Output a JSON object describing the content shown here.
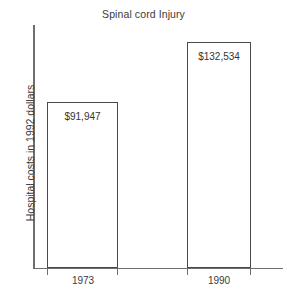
{
  "chart_data": {
    "type": "bar",
    "title": "Spinal cord Injury",
    "xlabel": "",
    "ylabel": "Hospital costs in 1992 dollars",
    "categories": [
      "1973",
      "1990"
    ],
    "values": [
      91947,
      132534
    ],
    "value_labels": [
      "$91,947",
      "$132,534"
    ],
    "ylim": [
      0,
      152000
    ],
    "grid": false,
    "legend": null,
    "axis_tick_labels_y": []
  },
  "figure": {
    "title": "Spinal cord Injury",
    "y_axis_title": "Hospital costs in 1992 dollars",
    "bars": [
      {
        "category": "1973",
        "value_label": "$91,947"
      },
      {
        "category": "1990",
        "value_label": "$132,534"
      }
    ]
  },
  "colors": {
    "background": "#ffffff",
    "bar_outline": "#4a4a4a",
    "bar_fill": "#ffffff",
    "axis": "#6e6e6e",
    "text": "#3a3a3a"
  }
}
